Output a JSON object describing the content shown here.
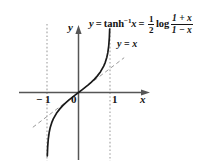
{
  "figure": {
    "background_color": "#ffffff",
    "axis_color": "#4a4a4a",
    "curve_color": "#1a1a1a",
    "dashed_color": "#9a9a9a",
    "dotted_color": "#b5b5b5",
    "axis_x_label": "x",
    "axis_y_label": "y",
    "ticks": {
      "neg_one": "− 1",
      "zero": "0",
      "one": "1"
    },
    "equation": {
      "lhs": "y",
      "equals_1": "=",
      "func": "tanh",
      "inverse_exponent": "−1",
      "arg": "x",
      "equals_2": "=",
      "coefficient_num": "1",
      "coefficient_den": "2",
      "log": "log",
      "ratio_num": "1 + x",
      "ratio_den": "1 − x"
    },
    "line_label": {
      "lhs": "y",
      "equals": "=",
      "rhs": "x"
    }
  },
  "chart_data": {
    "type": "line",
    "xlabel": "x",
    "ylabel": "y",
    "xlim": [
      -1.6,
      1.6
    ],
    "ylim": [
      -2.4,
      2.4
    ],
    "grid": false,
    "legend": "inline-annotation",
    "series": [
      {
        "name": "y = tanh^-1 x",
        "style": "solid",
        "color": "#1a1a1a",
        "x": [
          -0.995,
          -0.99,
          -0.98,
          -0.96,
          -0.93,
          -0.9,
          -0.85,
          -0.8,
          -0.7,
          -0.6,
          -0.5,
          -0.4,
          -0.3,
          -0.2,
          -0.1,
          0,
          0.1,
          0.2,
          0.3,
          0.4,
          0.5,
          0.6,
          0.7,
          0.8,
          0.85,
          0.9,
          0.93,
          0.96,
          0.98,
          0.99,
          0.995
        ],
        "y": [
          -2.994,
          -2.646,
          -2.298,
          -1.946,
          -1.658,
          -1.472,
          -1.256,
          -1.099,
          -0.867,
          -0.693,
          -0.549,
          -0.424,
          -0.31,
          -0.203,
          -0.1,
          0,
          0.1,
          0.203,
          0.31,
          0.424,
          0.549,
          0.693,
          0.867,
          1.099,
          1.256,
          1.472,
          1.658,
          1.946,
          2.298,
          2.646,
          2.994
        ]
      },
      {
        "name": "y = x",
        "style": "dashed",
        "color": "#9a9a9a",
        "x": [
          -1.45,
          1.45
        ],
        "y": [
          -1.45,
          1.45
        ]
      }
    ],
    "asymptotes": [
      {
        "type": "vertical",
        "x": -1,
        "style": "dotted",
        "color": "#b5b5b5"
      },
      {
        "type": "vertical",
        "x": 1,
        "style": "dotted",
        "color": "#b5b5b5"
      }
    ],
    "annotations": [
      {
        "text": "y = tanh−1x = 1/2 log (1+x)/(1−x)",
        "x": 0.8,
        "y": 2.3
      },
      {
        "text": "y = x",
        "x": 1.15,
        "y": 1.45
      }
    ],
    "xticks": [
      -1,
      0,
      1
    ],
    "xticklabels": [
      "− 1",
      "0",
      "1"
    ]
  }
}
